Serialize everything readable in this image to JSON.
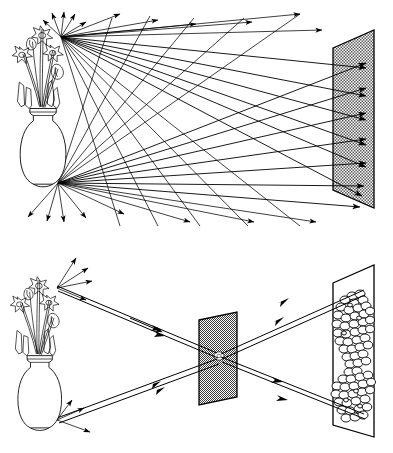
{
  "figure": {
    "background_color": "#ffffff",
    "ink_color": "#000000",
    "screen_shade_color": "#c8c8c8",
    "width": 393,
    "height": 453
  },
  "panels": [
    {
      "id": "top-panel",
      "name": "scattered-light-panel",
      "caption": "",
      "object": {
        "name": "vase-of-flowers",
        "type": "vase-with-daffodils",
        "flower_count": 5,
        "position": {
          "x": 50,
          "y": 120
        }
      },
      "ray_sources": [
        {
          "name": "upper-source-point",
          "label": "top flower",
          "x": 61,
          "y": 37,
          "ray_count": 24
        },
        {
          "name": "lower-source-point",
          "label": "vase base",
          "x": 58,
          "y": 183,
          "ray_count": 24
        }
      ],
      "screen": {
        "name": "screen",
        "shaded": true,
        "shade_color": "#c8c8c8",
        "corners": "333,48 374,30 374,208 333,190"
      },
      "arrows_reaching_screen": 9,
      "note": "Every point of the object sends rays in all directions; the whole screen is illuminated by every point so no image forms."
    },
    {
      "id": "bottom-panel",
      "name": "pinhole-image-panel",
      "caption": "",
      "object": {
        "name": "vase-of-flowers",
        "type": "vase-with-daffodils",
        "flower_count": 5,
        "position": {
          "x": 45,
          "y": 350
        }
      },
      "ray_sources": [
        {
          "name": "upper-source-point",
          "label": "top flower",
          "x": 57,
          "y": 288,
          "ray_count": 5
        },
        {
          "name": "lower-source-point",
          "label": "vase base",
          "x": 57,
          "y": 420,
          "ray_count": 5
        }
      ],
      "barrier": {
        "name": "pinhole-barrier",
        "shaded": true,
        "shade_color": "#c8c8c8",
        "corners": "199,320 237,312 237,397 199,405",
        "pinhole": {
          "name": "pinhole",
          "x": 219,
          "y": 356,
          "radius": 3.5
        }
      },
      "screen": {
        "name": "screen",
        "shaded": false,
        "corners": "333,283 374,265 374,437 333,425"
      },
      "image": {
        "name": "inverted-image",
        "orientation": "inverted",
        "rendering": "cluster-of-circles",
        "blob_count": 86
      },
      "beams": [
        {
          "name": "beam-top-to-bottom",
          "from": "upper-source-point",
          "through": "pinhole",
          "to": "image-lower-region"
        },
        {
          "name": "beam-bottom-to-top",
          "from": "lower-source-point",
          "through": "pinhole",
          "to": "image-upper-region"
        }
      ],
      "note": "The pinhole admits only one ray from each object point, so an inverted image forms on the screen."
    }
  ]
}
